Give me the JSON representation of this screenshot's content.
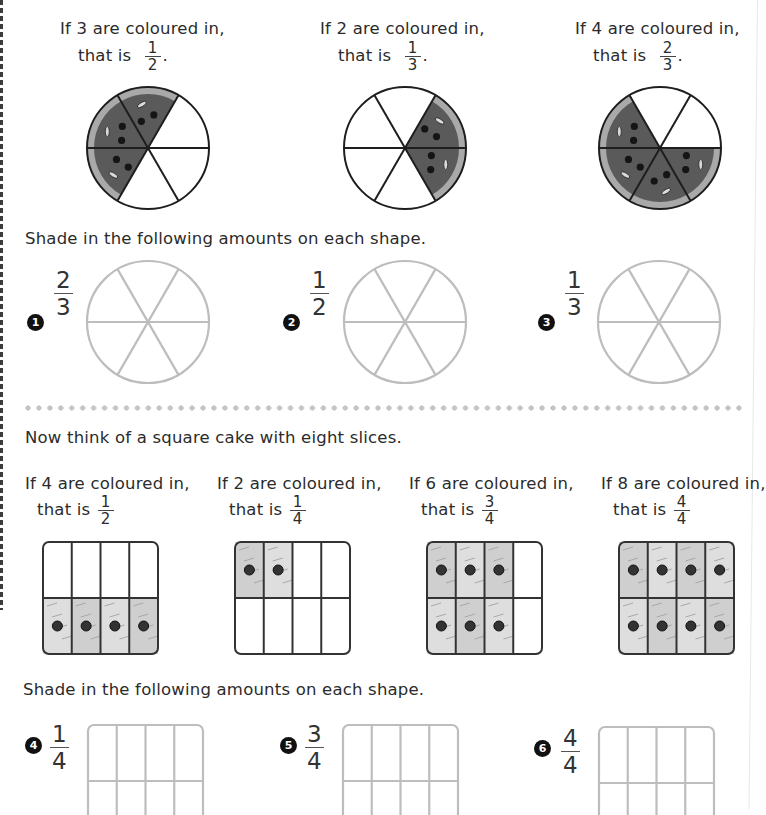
{
  "colors": {
    "pizza_sauce": "#5a5a5a",
    "pizza_crust": "#a9a9a9",
    "cake_fill": "#d6d6d6",
    "outline_dark": "#1e1e1e",
    "outline_light": "#bdbdbd",
    "divider_dots": "#c4c4c4"
  },
  "pizza_examples": [
    {
      "line1": "If 3 are coloured in,",
      "line2": "that is",
      "num": "1",
      "den": "2",
      "suffix": ".",
      "slices_total": 6,
      "shaded_slices": [
        1,
        2,
        3
      ]
    },
    {
      "line1": "If 2 are coloured in,",
      "line2": "that is",
      "num": "1",
      "den": "3",
      "suffix": ".",
      "slices_total": 6,
      "shaded_slices": [
        0,
        5
      ]
    },
    {
      "line1": "If 4 are coloured in,",
      "line2": "that is",
      "num": "2",
      "den": "3",
      "suffix": ".",
      "slices_total": 6,
      "shaded_slices": [
        2,
        3,
        4,
        5
      ]
    }
  ],
  "circle_instruction": "Shade in the following amounts on each shape.",
  "circle_exercises": [
    {
      "number": "1",
      "num": "2",
      "den": "3"
    },
    {
      "number": "2",
      "num": "1",
      "den": "2"
    },
    {
      "number": "3",
      "num": "1",
      "den": "3"
    }
  ],
  "cake_intro": "Now think of a square cake with eight slices.",
  "cake_examples": [
    {
      "line1": "If 4 are coloured in,",
      "line2": "that is",
      "num": "1",
      "den": "2",
      "shaded_cells": [
        4,
        5,
        6,
        7
      ]
    },
    {
      "line1": "If 2 are coloured in,",
      "line2": "that is",
      "num": "1",
      "den": "4",
      "shaded_cells": [
        0,
        1
      ]
    },
    {
      "line1": "If 6 are coloured in,",
      "line2": "that is",
      "num": "3",
      "den": "4",
      "shaded_cells": [
        0,
        1,
        2,
        4,
        5,
        6
      ]
    },
    {
      "line1": "If 8 are coloured in,",
      "line2": "that is",
      "num": "4",
      "den": "4",
      "shaded_cells": [
        0,
        1,
        2,
        3,
        4,
        5,
        6,
        7
      ]
    }
  ],
  "square_instruction": "Shade in the following amounts on each shape.",
  "square_exercises": [
    {
      "number": "4",
      "num": "1",
      "den": "4"
    },
    {
      "number": "5",
      "num": "3",
      "den": "4"
    },
    {
      "number": "6",
      "num": "4",
      "den": "4"
    }
  ]
}
